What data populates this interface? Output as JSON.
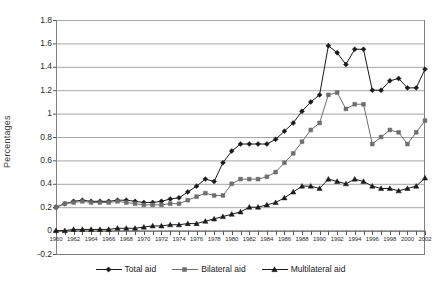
{
  "chart": {
    "type": "line",
    "ylabel": "Percentages",
    "xlabel": "",
    "title": ""
  },
  "axis": {
    "y_ticks": [
      "1.8",
      "1.6",
      "1.4",
      "1.2",
      "1",
      "0.8",
      "0.6",
      "0.4",
      "0.2",
      "0",
      "-0.2"
    ],
    "x_ticks": [
      "1960",
      "1962",
      "1964",
      "1966",
      "1968",
      "1970",
      "1972",
      "1974",
      "1976",
      "1978",
      "1980",
      "1982",
      "1984",
      "1986",
      "1988",
      "1990",
      "1992",
      "1994",
      "1996",
      "1998",
      "2000",
      "2002"
    ]
  },
  "legend": {
    "entries": [
      {
        "label": "Total aid",
        "marker": "diamond",
        "color": "#1a1a1a"
      },
      {
        "label": "Bilateral aid",
        "marker": "square",
        "color": "#6e6e6e"
      },
      {
        "label": "Multilateral aid",
        "marker": "triangle",
        "color": "#1a1a1a"
      }
    ]
  },
  "chart_data": {
    "type": "line",
    "title": "",
    "xlabel": "",
    "ylabel": "Percentages",
    "ylim": [
      -0.2,
      1.8
    ],
    "xlim": [
      1960,
      2002
    ],
    "grid": true,
    "legend_position": "bottom",
    "x": [
      1960,
      1961,
      1962,
      1963,
      1964,
      1965,
      1966,
      1967,
      1968,
      1969,
      1970,
      1971,
      1972,
      1973,
      1974,
      1975,
      1976,
      1977,
      1978,
      1979,
      1980,
      1981,
      1982,
      1983,
      1984,
      1985,
      1986,
      1987,
      1988,
      1989,
      1990,
      1991,
      1992,
      1993,
      1994,
      1995,
      1996,
      1997,
      1998,
      1999,
      2000,
      2001,
      2002
    ],
    "series": [
      {
        "name": "Total aid",
        "marker": "diamond",
        "color": "#1a1a1a",
        "values": [
          0.2,
          0.23,
          0.25,
          0.26,
          0.25,
          0.25,
          0.25,
          0.26,
          0.26,
          0.25,
          0.24,
          0.24,
          0.25,
          0.27,
          0.28,
          0.33,
          0.38,
          0.44,
          0.42,
          0.58,
          0.68,
          0.74,
          0.74,
          0.74,
          0.74,
          0.78,
          0.85,
          0.92,
          1.02,
          1.1,
          1.16,
          1.58,
          1.52,
          1.42,
          1.55,
          1.55,
          1.2,
          1.2,
          1.28,
          1.3,
          1.22,
          1.22,
          1.38
        ]
      },
      {
        "name": "Bilateral aid",
        "marker": "square",
        "color": "#6e6e6e",
        "values": [
          0.2,
          0.23,
          0.24,
          0.25,
          0.24,
          0.24,
          0.24,
          0.25,
          0.24,
          0.23,
          0.22,
          0.22,
          0.22,
          0.23,
          0.23,
          0.26,
          0.29,
          0.32,
          0.3,
          0.3,
          0.4,
          0.44,
          0.44,
          0.44,
          0.46,
          0.5,
          0.58,
          0.66,
          0.76,
          0.86,
          0.92,
          1.16,
          1.18,
          1.04,
          1.08,
          1.08,
          0.74,
          0.8,
          0.86,
          0.84,
          0.74,
          0.84,
          0.94
        ]
      },
      {
        "name": "Multilateral aid",
        "marker": "triangle",
        "color": "#1a1a1a",
        "values": [
          0.0,
          0.0,
          0.01,
          0.01,
          0.01,
          0.01,
          0.01,
          0.02,
          0.02,
          0.02,
          0.03,
          0.04,
          0.04,
          0.05,
          0.05,
          0.06,
          0.06,
          0.08,
          0.1,
          0.12,
          0.14,
          0.16,
          0.2,
          0.2,
          0.22,
          0.24,
          0.28,
          0.33,
          0.38,
          0.38,
          0.36,
          0.44,
          0.42,
          0.4,
          0.44,
          0.42,
          0.38,
          0.36,
          0.36,
          0.34,
          0.36,
          0.38,
          0.45
        ]
      }
    ]
  }
}
